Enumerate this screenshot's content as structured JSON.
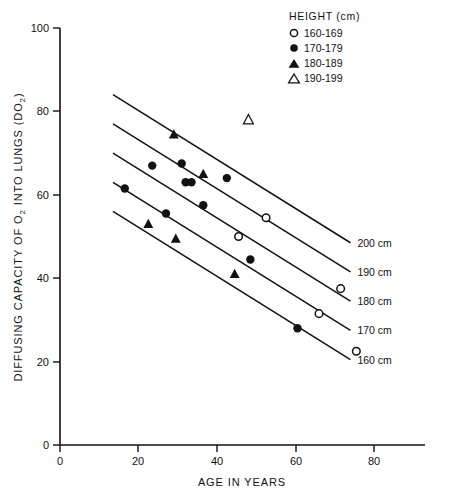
{
  "chart_data": {
    "type": "scatter",
    "title": "",
    "xlabel": "AGE IN YEARS",
    "ylabel": "DIFFUSING CAPACITY OF O2 INTO LUNGS (DO2)",
    "ylabel_parts": {
      "a": "DIFFUSING CAPACITY OF O",
      "sub1": "2",
      "b": " INTO LUNGS (DO",
      "sub2": "2",
      "c": ")"
    },
    "xlim": [
      0,
      88
    ],
    "ylim": [
      0,
      100
    ],
    "xticks": [
      0,
      20,
      40,
      60,
      80
    ],
    "yticks": [
      0,
      20,
      40,
      60,
      80,
      100
    ],
    "grid": false,
    "legend_position": "top-right",
    "legend": {
      "title": "HEIGHT (cm)",
      "entries": [
        {
          "label": "160-169",
          "marker": "open-circle"
        },
        {
          "label": "170-179",
          "marker": "filled-circle"
        },
        {
          "label": "180-189",
          "marker": "filled-triangle"
        },
        {
          "label": "190-199",
          "marker": "open-triangle"
        }
      ]
    },
    "series": [
      {
        "name": "160-169",
        "marker": "open-circle",
        "points": [
          {
            "x": 52.5,
            "y": 54.5
          },
          {
            "x": 45.5,
            "y": 50.0
          },
          {
            "x": 71.5,
            "y": 37.5
          },
          {
            "x": 66.0,
            "y": 31.5
          },
          {
            "x": 75.5,
            "y": 22.5
          }
        ]
      },
      {
        "name": "170-179",
        "marker": "filled-circle",
        "points": [
          {
            "x": 23.5,
            "y": 67.0
          },
          {
            "x": 31.0,
            "y": 67.5
          },
          {
            "x": 32.0,
            "y": 63.0
          },
          {
            "x": 33.5,
            "y": 63.0
          },
          {
            "x": 42.5,
            "y": 64.0
          },
          {
            "x": 16.5,
            "y": 61.5
          },
          {
            "x": 36.5,
            "y": 57.5
          },
          {
            "x": 27.0,
            "y": 55.5
          },
          {
            "x": 48.5,
            "y": 44.5
          },
          {
            "x": 60.5,
            "y": 28.0
          }
        ]
      },
      {
        "name": "180-189",
        "marker": "filled-triangle",
        "points": [
          {
            "x": 29.0,
            "y": 74.5
          },
          {
            "x": 36.5,
            "y": 65.0
          },
          {
            "x": 22.5,
            "y": 53.0
          },
          {
            "x": 29.5,
            "y": 49.5
          },
          {
            "x": 44.5,
            "y": 41.0
          }
        ]
      },
      {
        "name": "190-199",
        "marker": "open-triangle",
        "points": [
          {
            "x": 48.0,
            "y": 78.0
          }
        ]
      }
    ],
    "regression_lines": [
      {
        "label": "200 cm",
        "x1": 13.5,
        "y1": 84.0,
        "x2": 74.0,
        "y2": 48.5
      },
      {
        "label": "190 cm",
        "x1": 13.5,
        "y1": 77.0,
        "x2": 74.0,
        "y2": 41.5
      },
      {
        "label": "180 cm",
        "x1": 13.5,
        "y1": 70.0,
        "x2": 74.0,
        "y2": 34.5
      },
      {
        "label": "170 cm",
        "x1": 13.5,
        "y1": 63.0,
        "x2": 74.0,
        "y2": 27.5
      },
      {
        "label": "160 cm",
        "x1": 13.5,
        "y1": 56.0,
        "x2": 74.0,
        "y2": 20.5
      }
    ]
  }
}
